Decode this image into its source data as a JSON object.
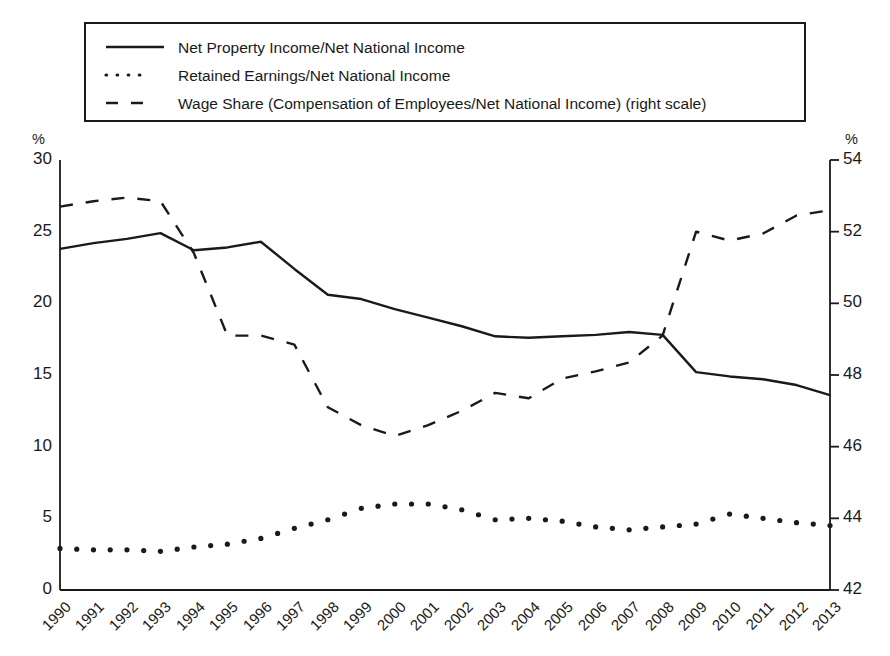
{
  "legend": {
    "items": [
      {
        "key": "solid-line-key",
        "label": "Net Property Income/Net National Income"
      },
      {
        "key": "dotted-line-key",
        "label": "Retained Earnings/Net National Income"
      },
      {
        "key": "dashed-line-key",
        "label": "Wage Share (Compensation of Employees/Net National Income) (right scale)"
      }
    ]
  },
  "axes": {
    "left_unit": "%",
    "right_unit": "%",
    "left_ticks": [
      "0",
      "5",
      "10",
      "15",
      "20",
      "25",
      "30"
    ],
    "right_ticks": [
      "42",
      "44",
      "46",
      "48",
      "50",
      "52",
      "54"
    ]
  },
  "chart_data": {
    "type": "line",
    "title": "",
    "xlabel": "",
    "ylabel": "%",
    "y2label": "%",
    "grid": false,
    "legend_position": "top",
    "ylim": [
      0,
      30
    ],
    "y2lim": [
      42,
      54
    ],
    "yticks": [
      0,
      5,
      10,
      15,
      20,
      25,
      30
    ],
    "y2ticks": [
      42,
      44,
      46,
      48,
      50,
      52,
      54
    ],
    "categories": [
      "1990",
      "1991",
      "1992",
      "1993",
      "1994",
      "1995",
      "1996",
      "1997",
      "1998",
      "1999",
      "2000",
      "2001",
      "2002",
      "2003",
      "2004",
      "2005",
      "2006",
      "2007",
      "2008",
      "2009",
      "2010",
      "2011",
      "2012",
      "2013"
    ],
    "series": [
      {
        "name": "Net Property Income/Net National Income",
        "style": "solid",
        "axis": "left",
        "values": [
          23.8,
          24.2,
          24.5,
          24.9,
          23.7,
          23.9,
          24.3,
          22.4,
          20.6,
          20.3,
          19.6,
          19.0,
          18.4,
          17.7,
          17.6,
          17.7,
          17.8,
          18.0,
          17.8,
          15.2,
          14.9,
          14.7,
          14.3,
          13.6
        ]
      },
      {
        "name": "Retained Earnings/Net National Income",
        "style": "dotted",
        "axis": "left",
        "values": [
          2.9,
          2.8,
          2.8,
          2.7,
          3.0,
          3.2,
          3.6,
          4.3,
          4.9,
          5.7,
          6.0,
          6.0,
          5.6,
          4.9,
          5.0,
          4.8,
          4.4,
          4.2,
          4.4,
          4.6,
          5.3,
          5.0,
          4.7,
          4.5
        ]
      },
      {
        "name": "Wage Share (Compensation of Employees/Net National Income) (right scale)",
        "style": "dashed",
        "axis": "right",
        "values": [
          52.7,
          52.85,
          52.95,
          52.85,
          51.4,
          49.1,
          49.1,
          48.85,
          47.1,
          46.6,
          46.3,
          46.6,
          47.0,
          47.5,
          47.35,
          47.9,
          48.1,
          48.35,
          49.1,
          52.0,
          51.75,
          51.95,
          52.45,
          52.6
        ]
      }
    ],
    "note": "Left series values are percentages on the left axis (0-30); the wage share series is read on the right axis (42-54)."
  }
}
